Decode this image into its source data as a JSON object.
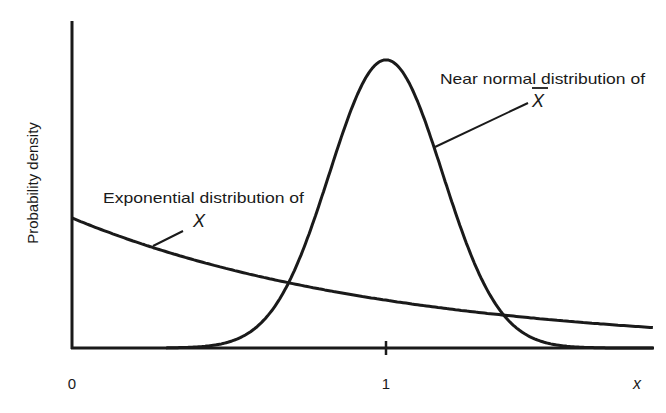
{
  "chart_data": {
    "type": "line",
    "title": "",
    "xlabel": "x",
    "ylabel": "Probability density",
    "xlim": [
      0,
      1.85
    ],
    "ylim": [
      0,
      2.4
    ],
    "x_ticks": [
      {
        "value": 0,
        "label": "0"
      },
      {
        "value": 1,
        "label": "1"
      }
    ],
    "y_ticks": [],
    "grid": false,
    "legend": null,
    "series": [
      {
        "name": "Exponential distribution of X",
        "kind": "exponential",
        "params": {
          "rate": 1.0,
          "mean": 1.0
        },
        "x": [
          0,
          0.25,
          0.5,
          0.75,
          1.0,
          1.25,
          1.5,
          1.75,
          1.85
        ],
        "values": [
          1.0,
          0.78,
          0.61,
          0.47,
          0.37,
          0.29,
          0.22,
          0.17,
          0.16
        ]
      },
      {
        "name": "Near normal distribution of X-bar",
        "kind": "normal",
        "params": {
          "mean": 1.0,
          "sd": 0.18
        },
        "x": [
          0.4,
          0.6,
          0.7,
          0.8,
          0.9,
          1.0,
          1.1,
          1.2,
          1.3,
          1.4,
          1.6
        ],
        "values": [
          0.01,
          0.19,
          0.55,
          1.19,
          1.9,
          2.19,
          1.9,
          1.19,
          0.55,
          0.19,
          0.01
        ]
      }
    ],
    "annotations": [
      {
        "text": "Exponential distribution of",
        "symbol": "X",
        "points_to": "Exponential distribution of X"
      },
      {
        "text": "Near normal distribution of",
        "symbol": "X̄",
        "points_to": "Near normal distribution of X-bar"
      }
    ]
  },
  "labels": {
    "y_axis": "Probability density",
    "x_axis": "x",
    "tick_0": "0",
    "tick_1": "1",
    "exp_annotation": "Exponential distribution of",
    "exp_symbol": "X",
    "normal_annotation": "Near normal distribution of",
    "normal_symbol": "X"
  },
  "colors": {
    "ink": "#1a1a1a",
    "background": "#ffffff"
  }
}
